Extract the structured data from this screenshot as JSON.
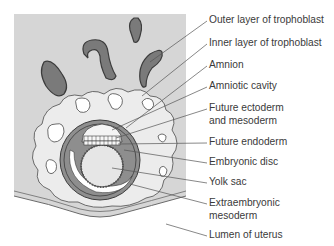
{
  "diagram": {
    "colors": {
      "uterine_wall": "#d6d6d6",
      "trophoblast_outer": "#ececec",
      "lacunae": "#ffffff",
      "glands": "#7a7a7a",
      "extraembryonic_mesoderm": "#8e8e8e",
      "yolk_sac": "#e6e6e6",
      "outline": "#3c3c3c",
      "leader_line": "#555555"
    },
    "labels": [
      {
        "id": "outer-trophoblast",
        "lines": [
          "Outer layer of trophoblast"
        ]
      },
      {
        "id": "inner-trophoblast",
        "lines": [
          "Inner layer of trophoblast"
        ]
      },
      {
        "id": "amnion",
        "lines": [
          "Amnion"
        ]
      },
      {
        "id": "amniotic-cavity",
        "lines": [
          "Amniotic cavity"
        ]
      },
      {
        "id": "future-ectoderm",
        "lines": [
          "Future ectoderm",
          "and mesoderm"
        ]
      },
      {
        "id": "future-endoderm",
        "lines": [
          "Future endoderm"
        ]
      },
      {
        "id": "embryonic-disc",
        "lines": [
          "Embryonic disc"
        ]
      },
      {
        "id": "yolk-sac",
        "lines": [
          "Yolk sac"
        ]
      },
      {
        "id": "extraembryonic-mesoderm",
        "lines": [
          "Extraembryonic",
          "mesoderm"
        ]
      },
      {
        "id": "lumen-of-uterus",
        "lines": [
          "Lumen of uterus"
        ]
      }
    ]
  }
}
